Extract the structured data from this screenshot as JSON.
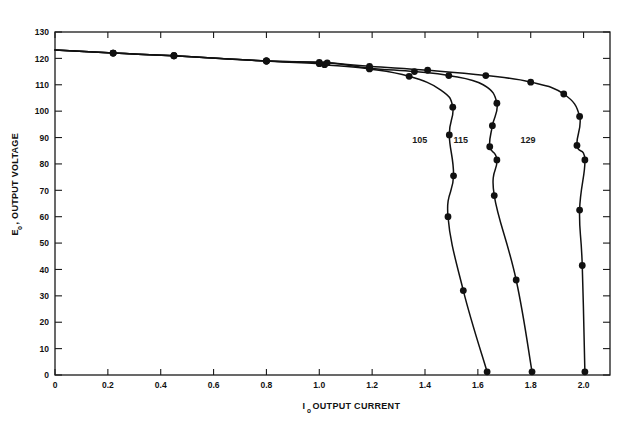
{
  "figure": {
    "background": "#ffffff",
    "ink_color": "#111111"
  },
  "chart_data": {
    "type": "line",
    "title": "",
    "subtitle": "",
    "xlabel_main": "OUTPUT CURRENT",
    "xlabel_symbol": "I",
    "xlabel_subscript": "o",
    "ylabel_main": "OUTPUT VOLTAGE",
    "ylabel_symbol": "E",
    "ylabel_subscript": "o",
    "xlim": [
      0,
      2.1
    ],
    "ylim": [
      0,
      130
    ],
    "grid": false,
    "legend_position": "inline-annotations",
    "xticks": [
      0,
      0.2,
      0.4,
      0.6,
      0.8,
      1.0,
      1.2,
      1.4,
      1.6,
      1.8,
      2.0
    ],
    "xticklabels": [
      "0",
      "0.2",
      "0.4",
      "0.6",
      "0.8",
      "1.0",
      "1.2",
      "1.4",
      "1.6",
      "1.8",
      "2.0"
    ],
    "yticks": [
      0,
      10,
      20,
      30,
      40,
      50,
      60,
      70,
      80,
      90,
      100,
      110,
      120,
      130
    ],
    "yticklabels": [
      "0",
      "10",
      "20",
      "30",
      "40",
      "50",
      "60",
      "70",
      "80",
      "90",
      "100",
      "110",
      "120",
      "130"
    ],
    "series": [
      {
        "name": "105",
        "label": "105",
        "label_x": 1.38,
        "label_y": 88,
        "points": [
          {
            "x": 0.0,
            "y": 123.2,
            "marker": false
          },
          {
            "x": 0.22,
            "y": 122.0,
            "marker": true
          },
          {
            "x": 0.45,
            "y": 121.0,
            "marker": true
          },
          {
            "x": 0.8,
            "y": 119.0,
            "marker": true
          },
          {
            "x": 1.0,
            "y": 118.0,
            "marker": true
          },
          {
            "x": 1.02,
            "y": 117.6,
            "marker": true
          },
          {
            "x": 1.19,
            "y": 116.0,
            "marker": true
          },
          {
            "x": 1.34,
            "y": 113.2,
            "marker": true
          },
          {
            "x": 1.46,
            "y": 108.0,
            "marker": false
          },
          {
            "x": 1.505,
            "y": 101.5,
            "marker": true
          },
          {
            "x": 1.492,
            "y": 91.0,
            "marker": true
          },
          {
            "x": 1.508,
            "y": 75.5,
            "marker": true
          },
          {
            "x": 1.487,
            "y": 60.0,
            "marker": true
          },
          {
            "x": 1.545,
            "y": 32.0,
            "marker": true
          },
          {
            "x": 1.635,
            "y": 1.2,
            "marker": true
          }
        ]
      },
      {
        "name": "115",
        "label": "115",
        "label_x": 1.535,
        "label_y": 88,
        "points": [
          {
            "x": 0.0,
            "y": 123.2,
            "marker": false
          },
          {
            "x": 0.22,
            "y": 122.0,
            "marker": true
          },
          {
            "x": 0.45,
            "y": 121.0,
            "marker": true
          },
          {
            "x": 0.8,
            "y": 119.0,
            "marker": true
          },
          {
            "x": 1.03,
            "y": 118.3,
            "marker": true
          },
          {
            "x": 1.19,
            "y": 116.3,
            "marker": true
          },
          {
            "x": 1.36,
            "y": 115.0,
            "marker": true
          },
          {
            "x": 1.49,
            "y": 113.5,
            "marker": true
          },
          {
            "x": 1.62,
            "y": 110.0,
            "marker": false
          },
          {
            "x": 1.672,
            "y": 103.0,
            "marker": true
          },
          {
            "x": 1.655,
            "y": 94.5,
            "marker": true
          },
          {
            "x": 1.645,
            "y": 86.5,
            "marker": true
          },
          {
            "x": 1.672,
            "y": 81.5,
            "marker": true
          },
          {
            "x": 1.662,
            "y": 68.0,
            "marker": true
          },
          {
            "x": 1.745,
            "y": 36.0,
            "marker": true
          },
          {
            "x": 1.805,
            "y": 1.2,
            "marker": true
          }
        ]
      },
      {
        "name": "129",
        "label": "129",
        "label_x": 1.79,
        "label_y": 88,
        "points": [
          {
            "x": 0.0,
            "y": 123.2,
            "marker": false
          },
          {
            "x": 0.22,
            "y": 122.0,
            "marker": true
          },
          {
            "x": 0.45,
            "y": 121.0,
            "marker": true
          },
          {
            "x": 0.8,
            "y": 119.0,
            "marker": true
          },
          {
            "x": 1.0,
            "y": 118.5,
            "marker": true
          },
          {
            "x": 1.19,
            "y": 117.0,
            "marker": true
          },
          {
            "x": 1.41,
            "y": 115.5,
            "marker": true
          },
          {
            "x": 1.63,
            "y": 113.5,
            "marker": true
          },
          {
            "x": 1.8,
            "y": 111.0,
            "marker": true
          },
          {
            "x": 1.925,
            "y": 106.5,
            "marker": true
          },
          {
            "x": 1.985,
            "y": 98.0,
            "marker": true
          },
          {
            "x": 1.975,
            "y": 87.0,
            "marker": true
          },
          {
            "x": 2.005,
            "y": 81.5,
            "marker": true
          },
          {
            "x": 1.985,
            "y": 62.5,
            "marker": true
          },
          {
            "x": 1.995,
            "y": 41.5,
            "marker": true
          },
          {
            "x": 2.005,
            "y": 1.2,
            "marker": true
          }
        ]
      }
    ]
  }
}
